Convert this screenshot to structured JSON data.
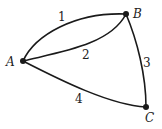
{
  "diagram": {
    "type": "multigraph",
    "nodes": [
      {
        "id": "A",
        "label": "A"
      },
      {
        "id": "B",
        "label": "B"
      },
      {
        "id": "C",
        "label": "C"
      }
    ],
    "edges": [
      {
        "id": "1",
        "label": "1",
        "from": "A",
        "to": "B"
      },
      {
        "id": "2",
        "label": "2",
        "from": "A",
        "to": "B"
      },
      {
        "id": "3",
        "label": "3",
        "from": "B",
        "to": "C"
      },
      {
        "id": "4",
        "label": "4",
        "from": "A",
        "to": "C"
      }
    ]
  }
}
